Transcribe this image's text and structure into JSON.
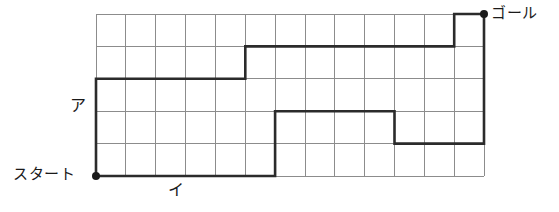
{
  "diagram": {
    "grid": {
      "columns": 13,
      "rows": 5,
      "origin_x": 96,
      "origin_y": 14,
      "cell_width": 29.85,
      "cell_height": 32.4,
      "line_color": "#8c8c8c",
      "line_width": 1
    },
    "path": {
      "stroke_color": "#2b2b2b",
      "stroke_width": 2.6,
      "upper_points": "96,176 96,78 245,78 245,46 454,46 454,14 484,14",
      "lower_points": "96,176 275,176 275,110 395,110 395,143 484,143 484,14"
    },
    "points": [
      {
        "name": "start",
        "label": "スタート",
        "x": 96,
        "y": 176,
        "radius": 4,
        "color": "#1a1a1a"
      },
      {
        "name": "goal",
        "label": "ゴール",
        "x": 484,
        "y": 14,
        "radius": 4,
        "color": "#1a1a1a"
      }
    ],
    "labels": {
      "start": "スタート",
      "goal": "ゴール",
      "side_a": "ア",
      "side_i": "イ"
    }
  }
}
